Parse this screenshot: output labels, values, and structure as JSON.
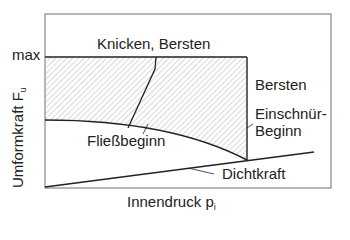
{
  "diagram": {
    "y_axis": {
      "label": "Umformkraft F",
      "subscript": "u",
      "tick_max": "max"
    },
    "x_axis": {
      "label": "Innendruck p",
      "subscript": "i"
    },
    "regions": {
      "top": "Knicken, Bersten",
      "right": "Bersten"
    },
    "curves": {
      "yield": "Fließbeginn",
      "necking_line1": "Einschnür-",
      "necking_line2": "Beginn",
      "sealing": "Dichtkraft"
    },
    "colors": {
      "line": "#222222",
      "frame": "#888888",
      "hatch": "#9a9a9a",
      "background": "#ffffff"
    }
  }
}
